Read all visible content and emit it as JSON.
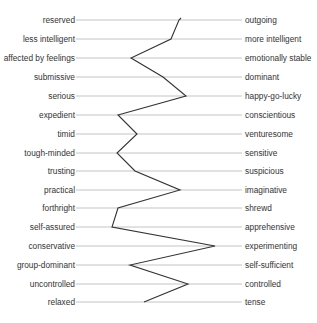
{
  "chart_data": {
    "type": "line",
    "title": "",
    "orientation": "horizontal-profile",
    "xlabel": "",
    "ylabel": "",
    "grid": true,
    "legend": null,
    "left_labels": [
      "reserved",
      "less intelligent",
      "affected by feelings",
      "submissive",
      "serious",
      "expedient",
      "timid",
      "tough-minded",
      "trusting",
      "practical",
      "forthright",
      "self-assured",
      "conservative",
      "group-dominant",
      "uncontrolled",
      "relaxed"
    ],
    "right_labels": [
      "outgoing",
      "more intelligent",
      "emotionally stable",
      "dominant",
      "happy-go-lucky",
      "conscientious",
      "venturesome",
      "sensitive",
      "suspicious",
      "imaginative",
      "shrewd",
      "apprehensive",
      "experimenting",
      "self-sufficient",
      "controlled",
      "tense"
    ],
    "series": [
      {
        "name": "profile",
        "values_pct_left_to_right": [
          63,
          57,
          33,
          52,
          66,
          25,
          37,
          25,
          36,
          63,
          25,
          22,
          84,
          33,
          67,
          41
        ]
      }
    ],
    "xlim": [
      0,
      100
    ]
  },
  "layout": {
    "line_x_start": 76,
    "line_x_end": 242,
    "row_y": [
      20,
      39,
      58,
      77,
      96,
      115,
      134,
      153,
      171,
      190,
      208,
      227,
      246,
      265,
      284,
      302
    ],
    "vertex_x": [
      179,
      171,
      131,
      163,
      186,
      118,
      137,
      117,
      135,
      180,
      118,
      112,
      215,
      130,
      188,
      144
    ],
    "colors": {
      "grid": "#b5b5b5",
      "profile": "#333333",
      "text": "#333333"
    }
  }
}
